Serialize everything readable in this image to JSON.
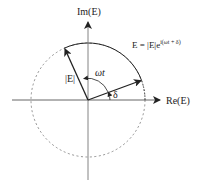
{
  "diagram": {
    "type": "phasor",
    "axes": {
      "horizontal_label": "Re(E)",
      "vertical_label": "Im(E)"
    },
    "equation": {
      "lhs": "E = |E|e",
      "exponent": "i(ωt + δ)"
    },
    "labels": {
      "magnitude": "|E|",
      "omega_t": "ωt",
      "delta": "δ"
    },
    "colors": {
      "line": "#222222",
      "axis": "#555555",
      "dashed_circle": "#666666"
    }
  }
}
